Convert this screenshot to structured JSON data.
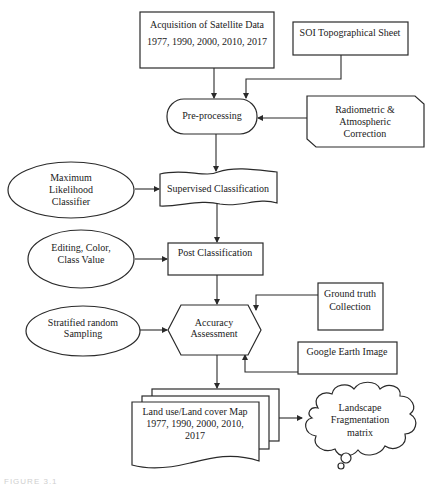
{
  "diagram": {
    "type": "flowchart",
    "colors": {
      "stroke": "#2a2a2a",
      "fill": "#ffffff",
      "text": "#222222"
    },
    "nodes": {
      "acquisition": {
        "shape": "rectangle",
        "line1": "Acquisition of Satellite Data",
        "line2": "1977, 1990, 2000, 2010, 2017"
      },
      "soi": {
        "shape": "rectangle",
        "line1": "SOI Topographical Sheet"
      },
      "preprocessing": {
        "shape": "terminator",
        "line1": "Pre-processing"
      },
      "radiometric": {
        "shape": "card",
        "line1": "Radiometric &",
        "line2": "Atmospheric",
        "line3": "Correction"
      },
      "mlc": {
        "shape": "ellipse",
        "line1": "Maximum",
        "line2": "Likelihood",
        "line3": "Classifier"
      },
      "supervised": {
        "shape": "tape",
        "line1": "Supervised Classification"
      },
      "editing": {
        "shape": "ellipse",
        "line1": "Editing, Color,",
        "line2": "Class Value"
      },
      "post": {
        "shape": "rectangle",
        "line1": "Post Classification"
      },
      "ground_truth": {
        "shape": "rectangle",
        "line1": "Ground truth",
        "line2": "Collection"
      },
      "stratified": {
        "shape": "ellipse",
        "line1": "Stratified random",
        "line2": "Sampling"
      },
      "accuracy": {
        "shape": "hexagon",
        "line1": "Accuracy",
        "line2": "Assessment"
      },
      "google_earth": {
        "shape": "rectangle",
        "line1": "Google Earth Image"
      },
      "lulc_map": {
        "shape": "multi-document",
        "line1": "Land use/Land cover Map",
        "line2": "1977, 1990, 2000, 2010,",
        "line3": "2017"
      },
      "fragmentation": {
        "shape": "cloud",
        "line1": "Landscape",
        "line2": "Fragmentation",
        "line3": "matrix"
      }
    },
    "edges": [
      {
        "from": "acquisition",
        "to": "preprocessing"
      },
      {
        "from": "soi",
        "to": "preprocessing"
      },
      {
        "from": "radiometric",
        "to": "preprocessing"
      },
      {
        "from": "preprocessing",
        "to": "supervised"
      },
      {
        "from": "mlc",
        "to": "supervised"
      },
      {
        "from": "supervised",
        "to": "post"
      },
      {
        "from": "editing",
        "to": "post"
      },
      {
        "from": "post",
        "to": "accuracy"
      },
      {
        "from": "ground_truth",
        "to": "accuracy"
      },
      {
        "from": "stratified",
        "to": "accuracy"
      },
      {
        "from": "google_earth",
        "to": "accuracy"
      },
      {
        "from": "accuracy",
        "to": "lulc_map"
      },
      {
        "from": "lulc_map",
        "to": "fragmentation"
      }
    ]
  },
  "caption": "FIGURE 3.1"
}
